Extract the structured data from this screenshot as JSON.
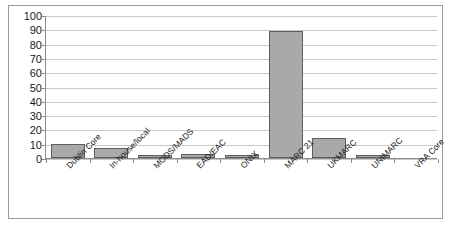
{
  "chart_data": {
    "type": "bar",
    "title": "",
    "subtitle": "",
    "xlabel": "",
    "ylabel": "",
    "ylim": [
      0,
      100
    ],
    "ytick_step": 10,
    "yticks": [
      100,
      90,
      80,
      70,
      60,
      50,
      40,
      30,
      20,
      10,
      0
    ],
    "grid": true,
    "legend": false,
    "legend_position": "none",
    "categories": [
      "Dublin Core",
      "In-house/local",
      "MODS/MADS",
      "EAD/EAC",
      "ONIX",
      "MARC 21",
      "UKMARC",
      "UNIMARC",
      "VRA Core"
    ],
    "values": [
      10,
      7,
      2,
      3,
      2,
      89,
      14,
      2,
      0
    ],
    "series": [
      {
        "name": "",
        "values": [
          10,
          7,
          2,
          3,
          2,
          89,
          14,
          2,
          0
        ]
      }
    ]
  },
  "style": {
    "bar_fill": "#a9a9a9",
    "bar_border": "#5e5e5e",
    "gridline_color": "#c9c9c9",
    "axis_color": "#8c8c8c",
    "frame_color": "#9a9a9a",
    "text_color": "#1a1a1a",
    "background": "#ffffff"
  },
  "caption": {
    "text": ""
  }
}
